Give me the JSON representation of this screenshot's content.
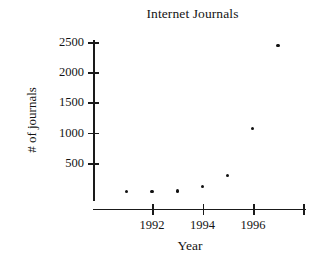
{
  "chart_data": {
    "type": "scatter",
    "title": "Internet Journals",
    "xlabel": "Year",
    "ylabel": "# of journals",
    "x": [
      1991,
      1992,
      1993,
      1994,
      1995,
      1996,
      1997
    ],
    "values": [
      35,
      35,
      40,
      120,
      290,
      1070,
      2440
    ],
    "series": [
      {
        "name": "Internet Journals",
        "values": [
          35,
          35,
          40,
          120,
          290,
          1070,
          2440
        ]
      }
    ],
    "xlim": [
      1990.6,
      1998.0
    ],
    "ylim": [
      0,
      2600
    ],
    "xticks": [
      1992,
      1994,
      1996,
      1998
    ],
    "xtick_labels": [
      "1992",
      "1994",
      "1996",
      ""
    ],
    "yticks": [
      500,
      1000,
      1500,
      2000,
      2500
    ],
    "ytick_labels": [
      "500",
      "1000",
      "1500",
      "2000",
      "2500"
    ],
    "grid": false,
    "legend": false,
    "legend_position": "none",
    "marker": "dot",
    "marker_color": "#111111",
    "axis_color": "#1a1a1a",
    "background_color": "#ffffff"
  }
}
